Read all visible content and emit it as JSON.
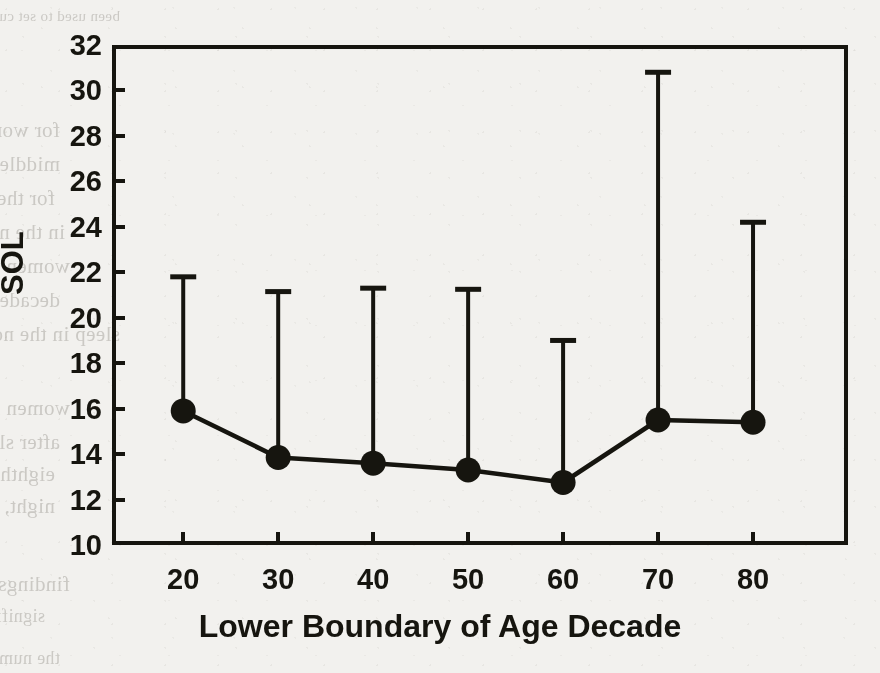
{
  "chart_data": {
    "type": "line",
    "title": "",
    "subtitle": "",
    "xlabel": "Lower Boundary of Age Decade",
    "ylabel": "SOL",
    "x": [
      20,
      30,
      40,
      50,
      60,
      70,
      80
    ],
    "categories": [
      "20",
      "30",
      "40",
      "50",
      "60",
      "70",
      "80"
    ],
    "values": [
      15.9,
      13.85,
      13.6,
      13.3,
      12.75,
      15.5,
      15.4
    ],
    "error_upper": [
      21.8,
      21.15,
      21.3,
      21.25,
      19.0,
      30.8,
      24.2
    ],
    "series": [
      {
        "name": "SOL",
        "values": [
          15.9,
          13.85,
          13.6,
          13.3,
          12.75,
          15.5,
          15.4
        ],
        "error_bar_tops": [
          21.8,
          21.15,
          21.3,
          21.25,
          19.0,
          30.8,
          24.2
        ],
        "marker": "filled-circle",
        "color": "#16150f"
      }
    ],
    "xlim": [
      12.5,
      90
    ],
    "ylim": [
      10,
      32
    ],
    "xticks": [
      20,
      30,
      40,
      50,
      60,
      70,
      80
    ],
    "yticks": [
      10,
      12,
      14,
      16,
      18,
      20,
      22,
      24,
      26,
      28,
      30,
      32
    ],
    "xtick_labels": [
      "20",
      "30",
      "40",
      "50",
      "60",
      "70",
      "80"
    ],
    "ytick_labels": [
      "10",
      "12",
      "14",
      "16",
      "18",
      "20",
      "22",
      "24",
      "26",
      "28",
      "30",
      "32"
    ],
    "grid": false,
    "legend": false,
    "legend_position": "none",
    "error_bar_style": "upper-only-with-cap",
    "frame": "box",
    "annotations": []
  },
  "colors": {
    "ink": "#16150f",
    "paper": "#f2f1ee",
    "bleed_text": "#6f6b63"
  },
  "background_bleed": {
    "description": "Faint mirrored show-through text from the reverse side of the scanned page",
    "lines": [
      {
        "text": "been used to set  cutpoints, the  numeric  results differ  from  the present",
        "x": 120,
        "y": 8,
        "size": 15
      },
      {
        "text": "for women with mild sleep apnea (AHI 5 to 15), the proportion of all the",
        "x": 60,
        "y": 118,
        "size": 21
      },
      {
        "text": "middle-aged women (mean  age 44) was 10 to 16% and was higher",
        "x": 60,
        "y": 152,
        "size": 21
      },
      {
        "text": "for the older group (mean age 60, SD = 6.6) who endorsed more sleepiness",
        "x": 55,
        "y": 186,
        "size": 21
      },
      {
        "text": "in the normal sample, the greatest SOL was found in the youngest",
        "x": 65,
        "y": 220,
        "size": 21
      },
      {
        "text": "women who also reported more awakenings and less sleep",
        "x": 70,
        "y": 254,
        "size": 21
      },
      {
        "text": "decade. Observed more than 7 h of sleep per night, consistent with",
        "x": 60,
        "y": 288,
        "size": 21
      },
      {
        "text": "sleep in the normal TST was similar.",
        "x": 120,
        "y": 322,
        "size": 21
      },
      {
        "text": "women in the oldest group reported the greatest number of awakenings",
        "x": 70,
        "y": 396,
        "size": 21
      },
      {
        "text": "after sleep onset, with a mean of 2.0 for women in the seventh and",
        "x": 60,
        "y": 430,
        "size": 21
      },
      {
        "text": "eighth decades. The present study participants reported 2.2 (SD = 1.9) per",
        "x": 55,
        "y": 462,
        "size": 21
      },
      {
        "text": "night, somewhat more than their mean of 1.5 (SD = 1.1). In contrast to the",
        "x": 55,
        "y": 494,
        "size": 21
      },
      {
        "text": "findings reported by other authors, the present data did not show",
        "x": 70,
        "y": 572,
        "size": 21
      },
      {
        "text": "significant relationships between age and total sleep time or sleep latency.",
        "x": 45,
        "y": 606,
        "size": 18
      },
      {
        "text": "the number of nocturnal awakenings increased with advancing age in",
        "x": 60,
        "y": 648,
        "size": 18
      }
    ]
  }
}
